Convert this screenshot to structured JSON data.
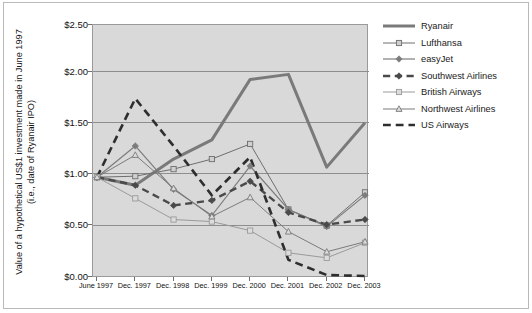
{
  "chart_data": {
    "type": "line",
    "title": "",
    "xlabel": "",
    "ylabel": "Value of a hypothetical US$1 investment made in June 1997\n(i.e., date of Ryanair IPO)",
    "categories": [
      "June 1997",
      "Dec. 1997",
      "Dec. 1998",
      "Dec. 1999",
      "Dec. 2000",
      "Dec. 2001",
      "Dec. 2002",
      "Dec. 2003"
    ],
    "ylim": [
      0.0,
      2.5
    ],
    "yticks": [
      0.0,
      0.5,
      1.0,
      1.5,
      2.0,
      2.5
    ],
    "ytick_labels": [
      "$0.00",
      "$0.50",
      "$1.00",
      "$1.50",
      "$2.00",
      "$2.50"
    ],
    "grid": true,
    "legend_position": "right",
    "series": [
      {
        "name": "Ryanair",
        "color": "#7a7a7a",
        "width": 3.0,
        "dash": "none",
        "marker": "none",
        "values": [
          1.0,
          0.92,
          1.18,
          1.37,
          1.97,
          2.02,
          1.1,
          1.54
        ]
      },
      {
        "name": "Lufthansa",
        "color": "#6e6e6e",
        "width": 1.0,
        "dash": "none",
        "marker": "square",
        "values": [
          1.0,
          1.01,
          1.08,
          1.18,
          1.33,
          0.68,
          0.52,
          0.85
        ]
      },
      {
        "name": "easyJet",
        "color": "#7c7c7c",
        "width": 1.2,
        "dash": "none",
        "marker": "diamond-filled",
        "values": [
          1.0,
          1.31,
          0.88,
          0.62,
          1.11,
          0.68,
          0.51,
          0.82
        ]
      },
      {
        "name": "Southwest Airlines",
        "color": "#4a4a4a",
        "width": 2.4,
        "dash": "dashed",
        "marker": "diamond-filled",
        "values": [
          1.0,
          0.92,
          0.72,
          0.77,
          0.96,
          0.65,
          0.53,
          0.58
        ]
      },
      {
        "name": "British Airways",
        "color": "#9a9a9a",
        "width": 1.0,
        "dash": "none",
        "marker": "square-open",
        "values": [
          1.0,
          0.79,
          0.58,
          0.56,
          0.47,
          0.25,
          0.2,
          0.35
        ]
      },
      {
        "name": "Northwest Airlines",
        "color": "#7b7b7b",
        "width": 1.0,
        "dash": "none",
        "marker": "triangle-open",
        "values": [
          1.0,
          1.22,
          0.89,
          0.61,
          0.8,
          0.46,
          0.26,
          0.36
        ]
      },
      {
        "name": "US Airways",
        "color": "#2e2e2e",
        "width": 2.6,
        "dash": "dashed",
        "marker": "none",
        "values": [
          1.0,
          1.78,
          1.31,
          0.82,
          1.2,
          0.18,
          0.03,
          0.02
        ]
      }
    ]
  },
  "figure": {
    "plot_background": "#d9d9d9",
    "page_background": "#ffffff",
    "grid_color": "#8e8e8e",
    "border_color": "#9a9a9a"
  }
}
